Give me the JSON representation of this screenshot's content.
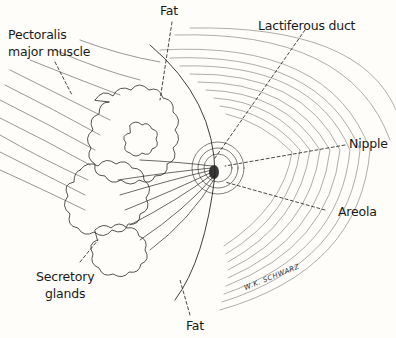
{
  "figure": {
    "background_color": "#fefdf9",
    "ink_color": "#1a1a1a"
  },
  "labels": {
    "pectoralis": "Pectoralis",
    "pectoralis_line2": "major muscle",
    "fat_top": "Fat",
    "lactiferous_duct": "Lactiferous duct",
    "nipple": "Nipple",
    "areola": "Areola",
    "secretory": "Secretory",
    "secretory_line2": "glands",
    "fat_bottom": "Fat"
  },
  "signature": "W.K. SCHWARZ"
}
